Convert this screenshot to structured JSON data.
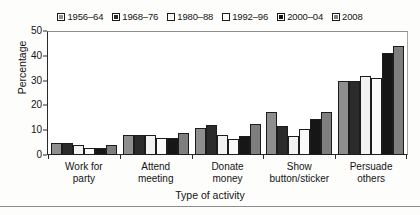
{
  "chart_data": {
    "type": "bar",
    "title": "",
    "xlabel": "Type of activity",
    "ylabel": "Percentage",
    "ylim": [
      0,
      50
    ],
    "yticks": [
      "0",
      "10",
      "20",
      "30",
      "40",
      "50"
    ],
    "ytick_values": [
      0,
      10,
      20,
      30,
      40,
      50
    ],
    "grid": false,
    "legend_position": "top-center",
    "categories": [
      "Work for party",
      "Attend meeting",
      "Donate money",
      "Show button/sticker",
      "Persuade others"
    ],
    "category_lines": [
      [
        "Work for",
        "party"
      ],
      [
        "Attend",
        "meeting"
      ],
      [
        "Donate",
        "money"
      ],
      [
        "Show",
        "button/sticker"
      ],
      [
        "Persuade",
        "others"
      ]
    ],
    "series": [
      {
        "name": "1956–64",
        "color": "#8e8e8e",
        "values": [
          5,
          8,
          11,
          17.5,
          30
        ]
      },
      {
        "name": "1968–76",
        "color": "#2b2b2b",
        "values": [
          5,
          8,
          12,
          11.5,
          30
        ]
      },
      {
        "name": "1980–88",
        "color": "#f2f2f2",
        "values": [
          4,
          8,
          8,
          7.5,
          32
        ]
      },
      {
        "name": "1992–96",
        "color": "#fafafa",
        "values": [
          3,
          7,
          6.5,
          10.5,
          31
        ]
      },
      {
        "name": "2000–04",
        "color": "#161616",
        "values": [
          3,
          7,
          7.5,
          14.5,
          41
        ]
      },
      {
        "name": "2008",
        "color": "#7e7e7e",
        "values": [
          4,
          9,
          12.5,
          17.5,
          44
        ]
      }
    ]
  }
}
